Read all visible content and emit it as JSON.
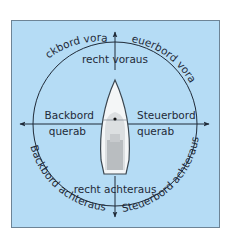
{
  "colors": {
    "background": "#ffffff",
    "panel_fill": "#b5dcf5",
    "panel_border": "#6d8496",
    "line": "#1f2a38",
    "hull_fill": "#f4f6f7",
    "hull_stroke": "#3a4650",
    "deck_light": "#dcdfe1",
    "deck_dark": "#b9bdc0"
  },
  "labels": {
    "ahead": "recht voraus",
    "astern": "recht achteraus",
    "port_beam_line1": "Backbord",
    "port_beam_line2": "querab",
    "starboard_beam_line1": "Steuerbord",
    "starboard_beam_line2": "querab",
    "port_bow": "Backbord voraus",
    "starboard_bow": "Steuerbord voraus",
    "port_quarter": "Backbord achteraus",
    "starboard_quarter": "Steuerbord achteraus"
  },
  "icons": {
    "boat": "sailboat-top-view-icon",
    "arrows": "arrow-icon"
  }
}
